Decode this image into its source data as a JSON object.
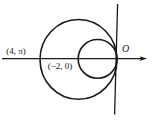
{
  "figure": {
    "background_color": "#ffffff",
    "stroke_color": "#1a1a1a",
    "labels": {
      "left_point": "(4, π)",
      "center_point": "(−2, 0)",
      "origin": "O"
    }
  }
}
